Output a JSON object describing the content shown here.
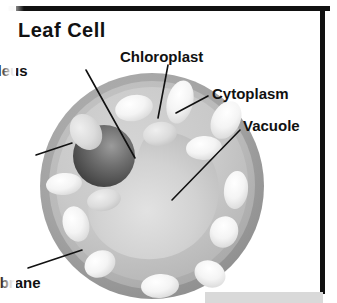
{
  "title": "Leaf Cell",
  "labels": {
    "nucleus": {
      "text": "ucleus",
      "full": "Nucleus"
    },
    "cell_wall_1": {
      "text": "ell",
      "full": "Cell"
    },
    "cell_wall_2": {
      "text": "all",
      "full": "Wall"
    },
    "cell_mem_1": {
      "text": "ell",
      "full": "Cell"
    },
    "cell_mem_2": {
      "text": "embrane",
      "full": "Membrane"
    },
    "chloroplast": {
      "text": "Chloroplast"
    },
    "cytoplasm": {
      "text": "Cytoplasm"
    },
    "vacuole": {
      "text": "Vacuole"
    }
  },
  "bottom_panel": {
    "caption": ""
  },
  "colors": {
    "ink": "#111111",
    "cell_wall_outer": "#9a9a9a",
    "cell_wall_inner": "#b6b6b6",
    "cytoplasm": "#c9c9c9",
    "vacuole": "#cccccc",
    "nucleus_dark": "#4f4f4f",
    "nucleus_light": "#8f8f8f",
    "chloroplast": "#f2f2f2",
    "page_background": "#ffffff",
    "panel_background": "#d9d9d9"
  },
  "diagram": {
    "type": "labelled-biology-diagram",
    "parts": [
      "Cell Wall",
      "Cell Membrane",
      "Cytoplasm",
      "Nucleus",
      "Vacuole",
      "Chloroplast"
    ]
  }
}
